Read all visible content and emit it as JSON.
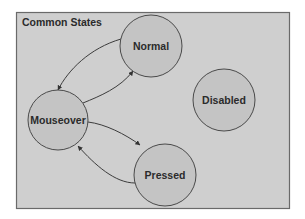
{
  "diagram": {
    "title": "Common States",
    "nodes": [
      {
        "id": "normal",
        "label": "Normal"
      },
      {
        "id": "mouseover",
        "label": "Mouseover"
      },
      {
        "id": "pressed",
        "label": "Pressed"
      },
      {
        "id": "disabled",
        "label": "Disabled"
      }
    ],
    "edges": [
      {
        "from": "normal",
        "to": "mouseover"
      },
      {
        "from": "mouseover",
        "to": "normal"
      },
      {
        "from": "mouseover",
        "to": "pressed"
      },
      {
        "from": "pressed",
        "to": "mouseover"
      }
    ],
    "colors": {
      "frame_fill": "#cfcfcf",
      "node_fill": "#c4c4c4",
      "stroke": "#4a4a4a",
      "text": "#2b2b2b"
    }
  }
}
